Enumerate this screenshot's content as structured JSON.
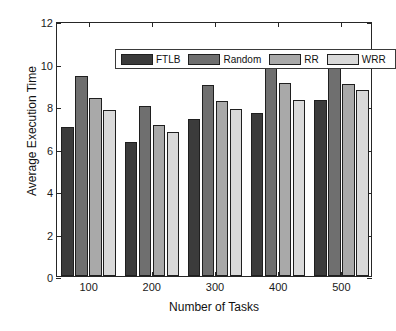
{
  "chart_data": {
    "type": "bar",
    "title": "",
    "xlabel": "Number of Tasks",
    "ylabel": "Average Execution Time",
    "categories": [
      "100",
      "200",
      "300",
      "400",
      "500"
    ],
    "series": [
      {
        "name": "FTLB",
        "color": "#3b3b3b",
        "values": [
          7.0,
          6.3,
          7.4,
          7.65,
          8.3
        ]
      },
      {
        "name": "Random",
        "color": "#6f6f6f",
        "values": [
          9.4,
          8.0,
          9.0,
          10.15,
          9.9
        ]
      },
      {
        "name": "RR",
        "color": "#a9a9a9",
        "values": [
          8.4,
          7.1,
          8.25,
          9.1,
          9.05
        ]
      },
      {
        "name": "WRR",
        "color": "#d9d9d9",
        "values": [
          7.8,
          6.8,
          7.85,
          8.3,
          8.75
        ]
      }
    ],
    "ylim": [
      0,
      12
    ],
    "yticks": [
      0,
      2,
      4,
      6,
      8,
      10,
      12
    ],
    "grid": false,
    "legend_position": "top-left-inside",
    "axis_color": "#262626"
  }
}
